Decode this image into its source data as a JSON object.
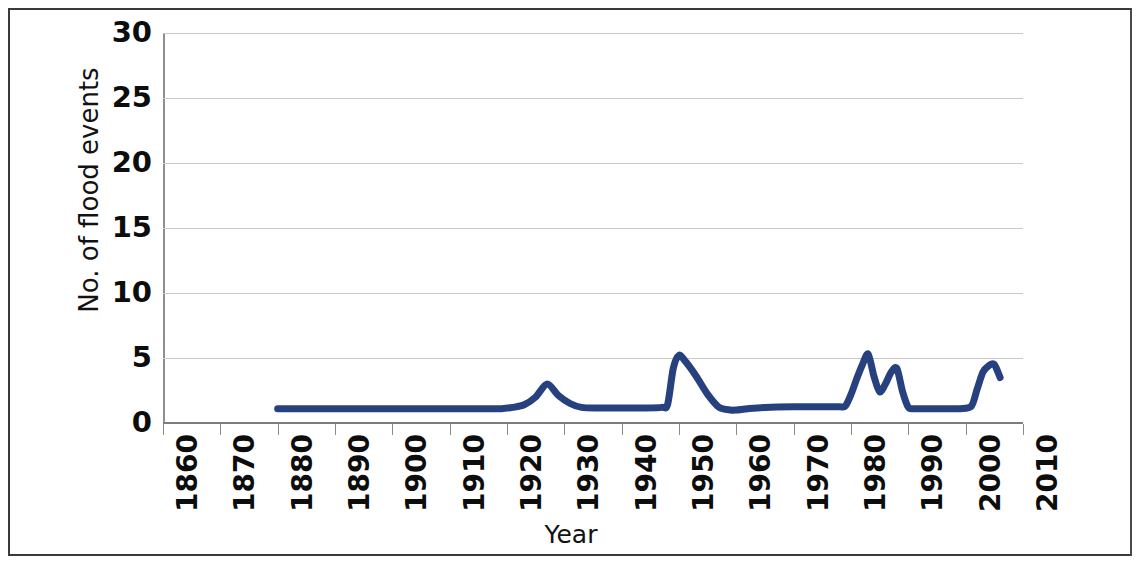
{
  "chart_data": {
    "type": "line",
    "title": "",
    "xlabel": "Year",
    "ylabel": "No. of flood events",
    "xlim": [
      1860,
      2010
    ],
    "ylim": [
      0,
      30
    ],
    "grid": true,
    "legend": false,
    "line_color": "#27417e",
    "x_tick_labels": [
      "1860",
      "1870",
      "1880",
      "1890",
      "1900",
      "1910",
      "1920",
      "1930",
      "1940",
      "1950",
      "1960",
      "1970",
      "1980",
      "1990",
      "2000",
      "2010"
    ],
    "y_tick_labels": [
      "0",
      "5",
      "10",
      "15",
      "20",
      "25",
      "30"
    ],
    "series": [
      {
        "name": "No. of flood events",
        "x": [
          1880,
          1885,
          1890,
          1895,
          1900,
          1905,
          1910,
          1915,
          1919,
          1921,
          1923,
          1925,
          1927,
          1929,
          1931,
          1933,
          1936,
          1940,
          1944,
          1947,
          1948,
          1949,
          1950,
          1951,
          1953,
          1955,
          1957,
          1959,
          1960,
          1962,
          1965,
          1970,
          1975,
          1978,
          1979,
          1980,
          1981,
          1982,
          1983,
          1984,
          1985,
          1986,
          1987,
          1988,
          1989,
          1990,
          1991,
          1993,
          1996,
          1999,
          2001,
          2002,
          2003,
          2004,
          2005,
          2006
        ],
        "y": [
          1.1,
          1.1,
          1.1,
          1.1,
          1.1,
          1.1,
          1.1,
          1.1,
          1.1,
          1.2,
          1.4,
          2.0,
          3.0,
          2.1,
          1.5,
          1.2,
          1.15,
          1.15,
          1.15,
          1.2,
          1.4,
          4.2,
          5.2,
          4.8,
          3.6,
          2.2,
          1.2,
          1.0,
          1.0,
          1.1,
          1.2,
          1.25,
          1.25,
          1.25,
          1.3,
          2.2,
          3.4,
          4.5,
          5.3,
          3.6,
          2.4,
          3.0,
          3.9,
          4.2,
          2.4,
          1.2,
          1.1,
          1.1,
          1.1,
          1.1,
          1.3,
          2.6,
          3.9,
          4.4,
          4.5,
          3.5
        ]
      }
    ],
    "annotations": {
      "peaks": [
        {
          "year": 1927,
          "value": 3.0
        },
        {
          "year": 1950,
          "value": 5.2
        },
        {
          "year": 1983,
          "value": 5.3
        },
        {
          "year": 1988,
          "value": 4.2
        },
        {
          "year": 2005,
          "value": 4.5
        }
      ],
      "baseline_value": 1.1,
      "data_start_year": 1880,
      "data_end_year": 2006
    }
  },
  "axes": {
    "y_title": "No. of flood events",
    "x_title": "Year"
  }
}
